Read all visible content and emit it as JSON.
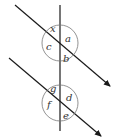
{
  "diagram": {
    "colors": {
      "line": "#1a1a1a",
      "circle": "#777777",
      "label": "#333333"
    },
    "upper_intersection": {
      "labels": {
        "top": "x",
        "right": "a",
        "left": "c",
        "bottom": "b"
      }
    },
    "lower_intersection": {
      "labels": {
        "top": "g",
        "right": "d",
        "left": "f",
        "bottom": "e"
      }
    }
  }
}
